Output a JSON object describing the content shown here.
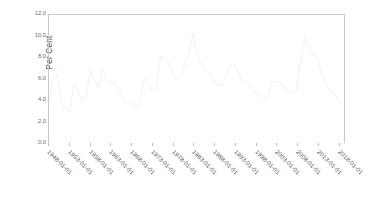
{
  "chart_data": {
    "type": "line",
    "title": "",
    "xlabel": "",
    "ylabel": "Per Cent",
    "ylim": [
      0.0,
      12.0
    ],
    "yticks": [
      "0.0",
      "2.0",
      "4.0",
      "6.0",
      "8.0",
      "10.0",
      "12.0"
    ],
    "ytick_values": [
      0.0,
      2.0,
      4.0,
      6.0,
      8.0,
      10.0,
      12.0
    ],
    "xticks": [
      "1948-01-01",
      "1953-01-01",
      "1958-01-01",
      "1963-01-01",
      "1968-01-01",
      "1973-01-01",
      "1978-01-01",
      "1983-01-01",
      "1988-01-01",
      "1993-01-01",
      "1998-01-01",
      "2003-01-01",
      "2008-01-01",
      "2013-01-01",
      "2018-01-01"
    ],
    "xtick_values": [
      1948,
      1953,
      1958,
      1963,
      1968,
      1973,
      1978,
      1983,
      1988,
      1993,
      1998,
      2003,
      2008,
      2013,
      2018
    ],
    "xlim": [
      1948,
      2019.5
    ],
    "grid": false,
    "legend": null,
    "line_color": "#f2f2f2",
    "axis_color": "#c9c9c9",
    "series": [
      {
        "name": "Per Cent",
        "x": [
          1948,
          1949,
          1950,
          1951,
          1952,
          1953,
          1954,
          1955,
          1956,
          1957,
          1958,
          1959,
          1960,
          1961,
          1962,
          1963,
          1964,
          1965,
          1966,
          1967,
          1968,
          1969,
          1970,
          1971,
          1972,
          1973,
          1974,
          1975,
          1976,
          1977,
          1978,
          1979,
          1980,
          1981,
          1982,
          1983,
          1984,
          1985,
          1986,
          1987,
          1988,
          1989,
          1990,
          1991,
          1992,
          1993,
          1994,
          1995,
          1996,
          1997,
          1998,
          1999,
          2000,
          2001,
          2002,
          2003,
          2004,
          2005,
          2006,
          2007,
          2008,
          2009,
          2010,
          2011,
          2012,
          2013,
          2014,
          2015,
          2016,
          2017,
          2018,
          2019
        ],
        "values": [
          3.8,
          6.0,
          6.5,
          3.7,
          3.2,
          2.9,
          5.5,
          4.9,
          4.0,
          4.2,
          6.8,
          6.0,
          5.2,
          6.9,
          5.8,
          5.7,
          5.6,
          4.9,
          4.0,
          3.9,
          3.7,
          3.4,
          3.9,
          5.9,
          5.9,
          4.9,
          5.1,
          8.1,
          7.9,
          7.5,
          6.4,
          5.9,
          6.3,
          7.5,
          8.6,
          10.4,
          8.0,
          7.3,
          6.7,
          6.6,
          5.7,
          5.4,
          5.4,
          6.4,
          7.3,
          7.3,
          6.6,
          5.6,
          5.6,
          5.3,
          4.7,
          4.3,
          4.0,
          4.2,
          5.7,
          5.8,
          5.7,
          5.3,
          4.7,
          4.6,
          5.0,
          7.8,
          9.8,
          9.1,
          8.3,
          8.0,
          6.6,
          5.7,
          4.9,
          4.8,
          4.1,
          3.8
        ]
      }
    ],
    "annotations": []
  }
}
